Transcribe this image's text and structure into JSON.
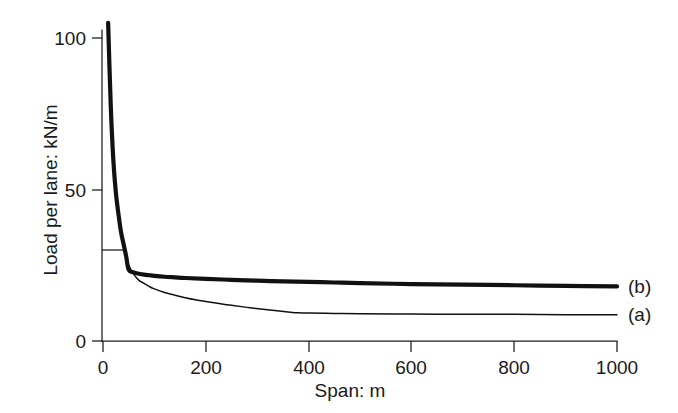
{
  "chart_data": {
    "type": "line",
    "title": "",
    "xlabel": "Span: m",
    "ylabel": "Load per lane: kN/m",
    "xlim": [
      0,
      1000
    ],
    "ylim": [
      0,
      110
    ],
    "xticks": [
      0,
      200,
      400,
      600,
      800,
      1000
    ],
    "xticklabels": [
      "0",
      "200",
      "400",
      "600",
      "800",
      "1000"
    ],
    "yticks": [
      0,
      50,
      100
    ],
    "yticklabels": [
      "0",
      "50",
      "100"
    ],
    "grid": false,
    "legend_position": "right-end-of-curve",
    "series": [
      {
        "name": "(a)",
        "label": "(a)",
        "style": "thin",
        "color": "#111111",
        "x": [
          10,
          15,
          20,
          25,
          30,
          35,
          40,
          45,
          50,
          60,
          70,
          80,
          90,
          100,
          120,
          140,
          160,
          180,
          200,
          240,
          280,
          320,
          360,
          380,
          400,
          450,
          500,
          600,
          700,
          800,
          900,
          1000
        ],
        "y": [
          105,
          78,
          60,
          49,
          42,
          36,
          32,
          28,
          25,
          22,
          20,
          19,
          18,
          17.2,
          16,
          15.1,
          14.3,
          13.6,
          13,
          12,
          11.1,
          10.3,
          9.6,
          9.3,
          9.2,
          9.1,
          9.0,
          8.9,
          8.8,
          8.8,
          8.7,
          8.7
        ]
      },
      {
        "name": "(b)",
        "label": "(b)",
        "style": "thick",
        "color": "#111111",
        "x": [
          10,
          15,
          20,
          25,
          30,
          35,
          40,
          45,
          50,
          60,
          70,
          80,
          90,
          100,
          120,
          140,
          160,
          200,
          250,
          300,
          350,
          400,
          450,
          500,
          600,
          700,
          800,
          900,
          1000
        ],
        "y": [
          105,
          78,
          60,
          49,
          42,
          36,
          32,
          28,
          23.5,
          22.6,
          22.2,
          21.9,
          21.7,
          21.5,
          21.2,
          21.0,
          20.8,
          20.5,
          20.2,
          19.9,
          19.7,
          19.5,
          19.3,
          19.1,
          18.8,
          18.6,
          18.4,
          18.2,
          18.0
        ]
      }
    ],
    "annotations": [
      {
        "name": "reference-tick-30",
        "type": "horizontal-tick",
        "y": 30,
        "x_from": 0,
        "x_to": 42
      }
    ]
  },
  "labels": {
    "ylabel": "Load per lane: kN/m",
    "xlabel": "Span: m",
    "x_0": "0",
    "x_200": "200",
    "x_400": "400",
    "x_600": "600",
    "x_800": "800",
    "x_1000": "1000",
    "y_0": "0",
    "y_50": "50",
    "y_100": "100",
    "series_a": "(a)",
    "series_b": "(b)"
  },
  "colors": {
    "background": "#ffffff",
    "ink": "#1a1a1a",
    "curve": "#111111"
  }
}
